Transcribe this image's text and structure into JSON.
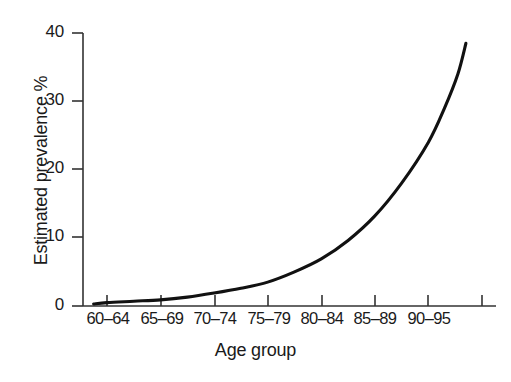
{
  "figure": {
    "background_color": "#ffffff",
    "line_color": "#111111",
    "axis_color": "#333333"
  },
  "chart_data": {
    "type": "line",
    "title": "",
    "xlabel": "Age group",
    "ylabel": "Estimated prevalence %",
    "categories": [
      "60–64",
      "65–69",
      "70–74",
      "75–79",
      "80–84",
      "85–89",
      "90–95"
    ],
    "yticks": [
      "0",
      "10",
      "20",
      "30",
      "40"
    ],
    "ytick_values": [
      0,
      10,
      20,
      30,
      40
    ],
    "ylim": [
      0,
      40
    ],
    "grid": false,
    "legend": null,
    "series": [
      {
        "name": "Estimated prevalence",
        "x": [
          "60–64",
          "65–69",
          "70–74",
          "75–79",
          "80–84",
          "85–89",
          "90–95"
        ],
        "values": [
          0.3,
          0.9,
          1.9,
          3.5,
          6.9,
          13.2,
          24.0
        ]
      }
    ],
    "curve_points": [
      [
        0.75,
        0.3
      ],
      [
        1.0,
        0.5
      ],
      [
        1.5,
        0.7
      ],
      [
        2.0,
        0.9
      ],
      [
        2.5,
        1.3
      ],
      [
        3.0,
        1.9
      ],
      [
        3.5,
        2.6
      ],
      [
        4.0,
        3.5
      ],
      [
        4.5,
        5.0
      ],
      [
        5.0,
        6.9
      ],
      [
        5.5,
        9.6
      ],
      [
        6.0,
        13.2
      ],
      [
        6.5,
        18.0
      ],
      [
        7.0,
        24.0
      ],
      [
        7.3,
        29.0
      ],
      [
        7.55,
        34.0
      ],
      [
        7.7,
        38.5
      ]
    ],
    "endpoint_value": 38.5,
    "start_value": 0.3
  }
}
